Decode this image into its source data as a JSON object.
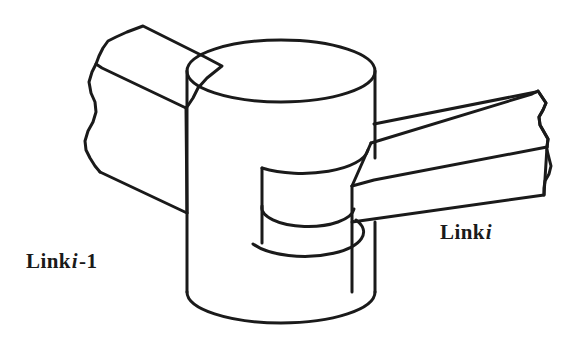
{
  "figure": {
    "name": "revolute-joint-link-diagram",
    "background_color": "#ffffff",
    "line_color": "#1a1a1a",
    "line_width_px": 3
  },
  "labels": {
    "link_previous": {
      "prefix": "Link",
      "symbol": "i",
      "suffix": "-1",
      "full_text": "Link i -1",
      "x": 26,
      "y": 251
    },
    "link_current": {
      "prefix": "Link",
      "symbol": "i",
      "suffix": "",
      "full_text": "Link i",
      "x": 440,
      "y": 222
    }
  },
  "geometry": {
    "outer_cylinder": {
      "top_ellipse": {
        "cx": 281,
        "cy": 71,
        "rx": 94,
        "ry": 31
      },
      "left_wall_x": 187,
      "right_wall_x": 375,
      "top_y": 71,
      "bottom_y": 292,
      "bottom_arc_ry": 31
    },
    "inner_cylinder": {
      "left_wall_x": 262,
      "right_wall_x": 352,
      "bottom_arc_cx": 307,
      "bottom_arc_cy": 222,
      "bottom_arc_rx": 46,
      "bottom_arc_ry": 19
    },
    "link_previous_bar": {
      "near_end_x": 187,
      "far_end_x": 88,
      "top_face_corners": "top-left bar sloping up-left from the cylinder"
    },
    "link_current_bar": {
      "near_end_x": 352,
      "far_end_x": 548,
      "top_face_corners": "right bar sloping up-right from the cylinder"
    }
  }
}
